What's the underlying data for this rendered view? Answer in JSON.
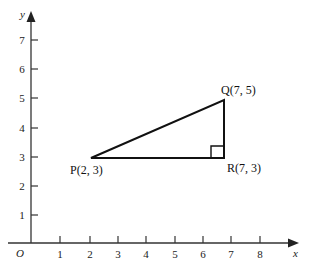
{
  "figure": {
    "type": "coordinate-geometry-diagram",
    "background_color": "#ffffff",
    "line_color": "#111111",
    "axis_color": "#333333"
  },
  "axes": {
    "x_axis": {
      "name": "x",
      "ticks": [
        "1",
        "2",
        "3",
        "4",
        "5",
        "6",
        "7",
        "8"
      ],
      "range": [
        0,
        8
      ],
      "arrow": true
    },
    "y_axis": {
      "name": "y",
      "ticks": [
        "1",
        "2",
        "3",
        "4",
        "5",
        "6",
        "7"
      ],
      "range": [
        0,
        7
      ],
      "arrow": true
    },
    "origin_label": "O"
  },
  "shape": {
    "kind": "right-triangle",
    "right_angle_at": "R",
    "vertices": [
      {
        "name": "P",
        "label": "P(2, 3)",
        "x": 2,
        "y": 3,
        "label_position": "below-left"
      },
      {
        "name": "Q",
        "label": "Q(7, 5)",
        "x": 7,
        "y": 5,
        "label_position": "above-right"
      },
      {
        "name": "R",
        "label": "R(7, 3)",
        "x": 7,
        "y": 3,
        "label_position": "below-right"
      }
    ],
    "edges": [
      {
        "from": "P",
        "to": "Q"
      },
      {
        "from": "Q",
        "to": "R"
      },
      {
        "from": "R",
        "to": "P"
      }
    ]
  }
}
